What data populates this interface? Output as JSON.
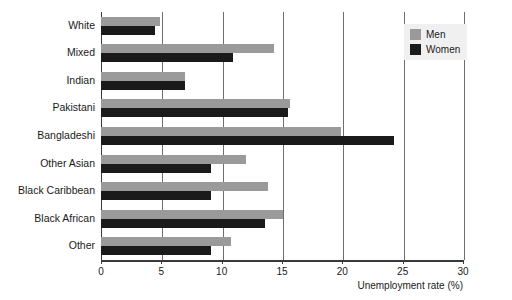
{
  "chart_data": {
    "type": "bar",
    "orientation": "horizontal",
    "title": "",
    "xlabel": "Unemployment rate (%)",
    "ylabel": "",
    "xlim": [
      0,
      30
    ],
    "xticks": [
      0,
      5,
      10,
      15,
      20,
      25,
      30
    ],
    "xtick_labels": [
      "0",
      "5",
      "10",
      "15",
      "20",
      "25",
      "30"
    ],
    "grid": true,
    "grid_axis": "x",
    "legend_position": "top-right",
    "categories": [
      "White",
      "Mixed",
      "Indian",
      "Pakistani",
      "Bangladeshi",
      "Other Asian",
      "Black Caribbean",
      "Black African",
      "Other"
    ],
    "series": [
      {
        "name": "Men",
        "color": "#9a9a9a",
        "values": [
          4.9,
          14.3,
          7.0,
          15.7,
          19.9,
          12.0,
          13.8,
          15.1,
          10.8
        ]
      },
      {
        "name": "Women",
        "color": "#1a1a1a",
        "values": [
          4.5,
          10.9,
          7.0,
          15.5,
          24.3,
          9.1,
          9.1,
          13.6,
          9.1
        ]
      }
    ]
  },
  "legend": {
    "entries": [
      {
        "label": "Men",
        "swatch": "men"
      },
      {
        "label": "Women",
        "swatch": "women"
      }
    ]
  }
}
